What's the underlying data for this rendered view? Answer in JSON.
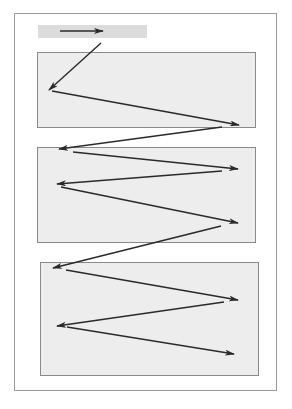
{
  "diagram": {
    "type": "z-pattern reading flow",
    "colors": {
      "background": "#ffffff",
      "frame_border": "#9a9a9a",
      "header_fill": "#dcdcdc",
      "box_fill": "#ededed",
      "box_border": "#8a8a8a",
      "arrow": "#2a2a2a"
    },
    "header": {
      "label": ""
    },
    "boxes": [
      {
        "id": "box-1",
        "x": 37,
        "y": 52,
        "w": 219,
        "h": 76
      },
      {
        "id": "box-2",
        "x": 37,
        "y": 147,
        "w": 219,
        "h": 96
      },
      {
        "id": "box-3",
        "x": 40,
        "y": 262,
        "w": 219,
        "h": 114
      }
    ],
    "arrows": [
      {
        "from": [
          60,
          31
        ],
        "to": [
          103,
          31
        ]
      },
      {
        "from": [
          101,
          43
        ],
        "to": [
          49,
          90
        ]
      },
      {
        "from": [
          52,
          91
        ],
        "to": [
          239,
          125
        ]
      },
      {
        "from": [
          222,
          127
        ],
        "to": [
          59,
          149
        ]
      },
      {
        "from": [
          73,
          152
        ],
        "to": [
          238,
          169
        ]
      },
      {
        "from": [
          222,
          171
        ],
        "to": [
          57,
          184
        ]
      },
      {
        "from": [
          61,
          187
        ],
        "to": [
          238,
          223
        ]
      },
      {
        "from": [
          221,
          226
        ],
        "to": [
          53,
          268
        ]
      },
      {
        "from": [
          66,
          270
        ],
        "to": [
          238,
          300
        ]
      },
      {
        "from": [
          224,
          302
        ],
        "to": [
          57,
          326
        ]
      },
      {
        "from": [
          67,
          327
        ],
        "to": [
          234,
          354
        ]
      }
    ]
  }
}
